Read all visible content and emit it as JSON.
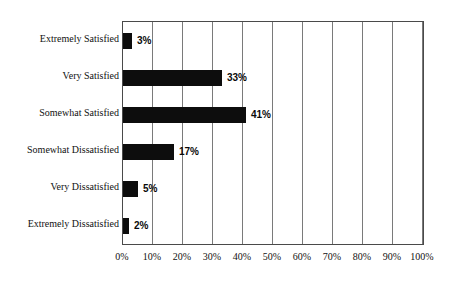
{
  "chart_data": {
    "type": "bar",
    "orientation": "horizontal",
    "title": "",
    "subtitle": "",
    "xlabel": "",
    "ylabel": "",
    "categories": [
      "Extremely Satisfied",
      "Very Satisfied",
      "Somewhat Satisfied",
      "Somewhat Dissatisfied",
      "Very Dissatisfied",
      "Extremely Dissatisfied"
    ],
    "values": [
      3,
      33,
      41,
      17,
      5,
      2
    ],
    "value_labels": [
      "3%",
      "33%",
      "41%",
      "17%",
      "5%",
      "2%"
    ],
    "xlim": [
      0,
      100
    ],
    "xticks": [
      0,
      10,
      20,
      30,
      40,
      50,
      60,
      70,
      80,
      90,
      100
    ],
    "xtick_labels": [
      "0%",
      "10%",
      "20%",
      "30%",
      "40%",
      "50%",
      "60%",
      "70%",
      "80%",
      "90%",
      "100%"
    ],
    "grid": true,
    "grid_axis": "x",
    "legend": false,
    "legend_position": "none",
    "bar_color": "#0d0d0d",
    "grid_color": "#7a7a7a",
    "frame_color": "#4a4a4a",
    "background_color": "#ffffff"
  }
}
